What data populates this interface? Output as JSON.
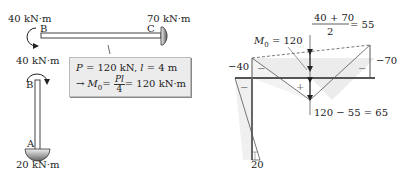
{
  "left_frame": {
    "moment_B_beam": "40 kN·m",
    "moment_C": "70 kN·m",
    "moment_B_column": "40 kN·m",
    "moment_A": "20 kN·m",
    "node_B_beam": "B",
    "node_C": "C",
    "node_B_column": "B",
    "node_A": "A",
    "info_box": {
      "line1_P": "P",
      "line1_eq": "= 120 kN,",
      "line1_l": "l",
      "line1_l_eq": "= 4 m",
      "line2_arrow": "→",
      "line2_M0": "M",
      "line2_M0_sub": "0",
      "line2_eq": "=",
      "frac_num": "Pl",
      "frac_den": "4",
      "line2_result": "= 120 kN·m"
    }
  },
  "moment_diagram": {
    "m0_label": "M",
    "m0_sub": "0",
    "m0_value": "= 120",
    "avg_num": "40 + 70",
    "avg_den": "2",
    "avg_result": "= 55",
    "left_value": "−40",
    "right_value": "−70",
    "mid_value": "120 − 55 = 65",
    "bottom_value": "20",
    "sign_minus": "−",
    "sign_plus": "+"
  },
  "colors": {
    "member": "#444444",
    "diagram_fill": "#e8e8e8",
    "box_bg": "#ececec"
  }
}
